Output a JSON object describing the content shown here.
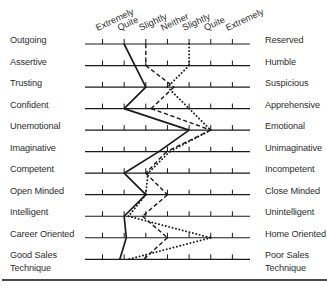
{
  "chart_data": {
    "type": "line",
    "title": "",
    "xlabel": "",
    "ylabel": "",
    "orientation": "semantic-differential profile (horizontal scales, one per row)",
    "scale_labels": [
      "Extremely",
      "Quite",
      "Slightly",
      "Neither",
      "Slightly",
      "Quite",
      "Extremely"
    ],
    "scale_range": [
      1,
      7
    ],
    "grid": false,
    "legend": "none",
    "rows": [
      {
        "left": "Outgoing",
        "right": "Reserved"
      },
      {
        "left": "Assertive",
        "right": "Humble"
      },
      {
        "left": "Trusting",
        "right": "Suspicious"
      },
      {
        "left": "Confident",
        "right": "Apprehensive"
      },
      {
        "left": "Unemotional",
        "right": "Emotional"
      },
      {
        "left": "Imaginative",
        "right": "Unimaginative"
      },
      {
        "left": "Competent",
        "right": "Incompetent"
      },
      {
        "left": "Open Minded",
        "right": "Close Minded"
      },
      {
        "left": "Intelligent",
        "right": "Unintelligent"
      },
      {
        "left": "Career Oriented",
        "right": "Home Oriented"
      },
      {
        "left": "Good Sales Technique",
        "right": "Poor Sales Technique"
      }
    ],
    "series": [
      {
        "line_style": "solid",
        "color": "#1a1a1a",
        "values": [
          2,
          2.5,
          3,
          2,
          5,
          3.6,
          2,
          3,
          2,
          2.1,
          1.8
        ]
      },
      {
        "line_style": "dashed",
        "color": "#1a1a1a",
        "values": [
          3,
          3,
          4.3,
          3.25,
          6,
          3.95,
          3,
          4,
          2.85,
          4,
          2.9
        ]
      },
      {
        "line_style": "dotted",
        "color": "#1a1a1a",
        "values": [
          5,
          5,
          4,
          5,
          6,
          4.1,
          3.1,
          3,
          2.2,
          6,
          2.2
        ]
      }
    ]
  },
  "colors": {
    "ink": "#1a1a1a",
    "text": "#2e2e2e",
    "background": "#ffffff"
  }
}
